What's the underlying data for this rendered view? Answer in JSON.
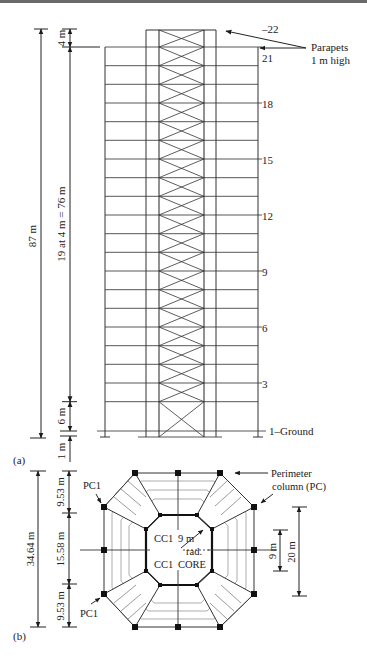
{
  "figure": {
    "part_a": {
      "label": "(a)",
      "dimensions": {
        "total_height": "87 m",
        "top_story": "4 m",
        "typical_stories": "19 at 4 m = 76 m",
        "first_story": "6 m",
        "below_ground": "1 m"
      },
      "floor_labels": {
        "roof": "–22",
        "f21": "21",
        "f18": "18",
        "f15": "15",
        "f12": "12",
        "f9": "9",
        "f6": "6",
        "f3": "3",
        "ground": "1–Ground"
      },
      "callout": {
        "line1": "Parapets",
        "line2": "1 m high"
      }
    },
    "part_b": {
      "label": "(b)",
      "dimensions": {
        "overall": "34.64 m",
        "top_segment": "9.53 m",
        "middle_segment": "15.58 m",
        "bottom_segment": "9.53 m",
        "core_inner": "9 m",
        "core_outer": "20 m"
      },
      "labels": {
        "pc1_top": "PC1",
        "pc1_bottom": "PC1",
        "cc1_top": "CC1",
        "cc1_bottom": "CC1",
        "core": "CORE",
        "radius_value": "9 m",
        "radius_unit": "rad."
      },
      "callout": {
        "line1": "Perimeter",
        "line2": "column (PC)"
      }
    },
    "colors": {
      "line": "#2a2a2a",
      "light_line": "#555555",
      "background": "#ffffff"
    }
  }
}
